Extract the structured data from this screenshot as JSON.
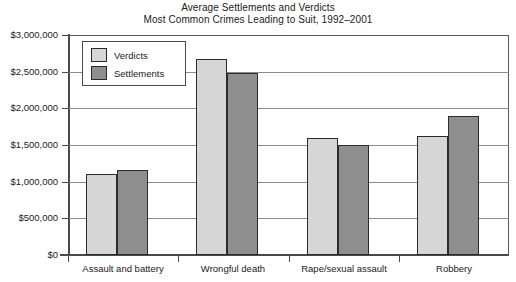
{
  "chart_data": {
    "type": "bar",
    "title": "Average Settlements and Verdicts",
    "subtitle": "Most Common Crimes Leading to Suit, 1992–2001",
    "xlabel": "",
    "ylabel": "",
    "ylim": [
      0,
      3000000
    ],
    "ytick_step": 500000,
    "ytick_labels": [
      "$3,000,000",
      "$2,500,000",
      "$2,000,000",
      "$1,500,000",
      "$1,000,000",
      "$500,000",
      "$0"
    ],
    "ytick_values": [
      3000000,
      2500000,
      2000000,
      1500000,
      1000000,
      500000,
      0
    ],
    "grid": true,
    "legend_position": "top-left-inside",
    "categories": [
      "Assault and battery",
      "Wrongful death",
      "Rape/sexual assault",
      "Robbery"
    ],
    "series": [
      {
        "name": "Verdicts",
        "color": "#d6d6d6",
        "values": [
          1110000,
          2670000,
          1590000,
          1620000
        ]
      },
      {
        "name": "Settlements",
        "color": "#8e8e8e",
        "values": [
          1160000,
          2480000,
          1500000,
          1900000
        ]
      }
    ]
  },
  "legend": {
    "entries": [
      {
        "label": "Verdicts"
      },
      {
        "label": "Settlements"
      }
    ]
  }
}
